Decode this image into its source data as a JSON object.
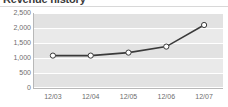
{
  "widget": {
    "title": "Revenue history"
  },
  "chart_data": {
    "type": "line",
    "title": "Revenue history",
    "xlabel": "",
    "ylabel": "",
    "categories": [
      "12/03",
      "12/04",
      "12/05",
      "12/06",
      "12/07"
    ],
    "values": [
      1080,
      1080,
      1180,
      1380,
      2100
    ],
    "series": [
      {
        "name": "Revenue",
        "values": [
          1080,
          1080,
          1180,
          1380,
          2100
        ]
      }
    ],
    "ylim": [
      0,
      2500
    ],
    "yticks": [
      0,
      500,
      1000,
      1500,
      2000,
      2500
    ],
    "ytick_labels": [
      "0",
      "500",
      "1,000",
      "1,500",
      "2,000",
      "2,500"
    ],
    "xtick_labels": [
      "12/03",
      "12/04",
      "12/05",
      "12/06",
      "12/07"
    ],
    "grid": true,
    "grid_orientation": "horizontal",
    "banded_background": true,
    "legend": false,
    "legend_position": "none",
    "marker": "open-circle",
    "line_color": "#3a3a3a",
    "marker_fill": "#ffffff",
    "marker_stroke": "#3a3a3a",
    "plot_background": "#eaeaea",
    "band_color": "#e2e2e2",
    "gridline_color": "#ffffff",
    "axis_text_color": "#6d6d6d",
    "title_color": "#3b3b3b"
  }
}
